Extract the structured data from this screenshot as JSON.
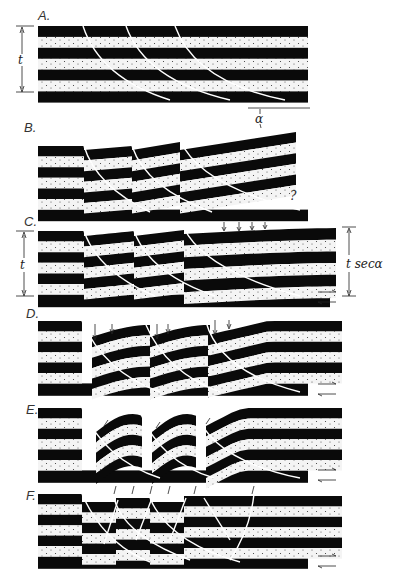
{
  "colors": {
    "bed_dark": "#0a0a0a",
    "bed_light": "#f4f4f4",
    "dot": "#333333",
    "line": "#222222",
    "background": "#ffffff"
  },
  "panels": [
    {
      "id": "A",
      "label": "A.",
      "top": 26,
      "left": 38,
      "right": 308,
      "bands": 7,
      "band_h": 10.9,
      "annotations": {
        "thickness_label": "t"
      }
    },
    {
      "id": "B",
      "label": "B.",
      "top": 146,
      "left": 38,
      "right": 308,
      "bands": 7,
      "band_h": 10.6,
      "annotations": {
        "angle_label": "α",
        "question_mark": "?"
      }
    },
    {
      "id": "C",
      "label": "C.",
      "top": 231,
      "left": 38,
      "right": 330,
      "bands": 7,
      "band_h": 10.6,
      "annotations": {
        "thickness_label": "t",
        "thickened_label": "t secα"
      }
    },
    {
      "id": "D",
      "label": "D.",
      "top": 321,
      "left": 38,
      "right": 342,
      "bands": 7,
      "band_h": 10.4
    },
    {
      "id": "E",
      "label": "E.",
      "top": 408,
      "left": 38,
      "right": 342,
      "bands": 7,
      "band_h": 10.4
    },
    {
      "id": "F",
      "label": "F.",
      "top": 494,
      "left": 38,
      "right": 342,
      "bands": 7,
      "band_h": 10.4
    }
  ],
  "labels": {
    "A": "A.",
    "B": "B.",
    "C": "C.",
    "D": "D.",
    "E": "E.",
    "F": "F.",
    "t_A": "t",
    "t_C": "t",
    "alpha": "α",
    "question": "?",
    "tsec": "t secα"
  }
}
